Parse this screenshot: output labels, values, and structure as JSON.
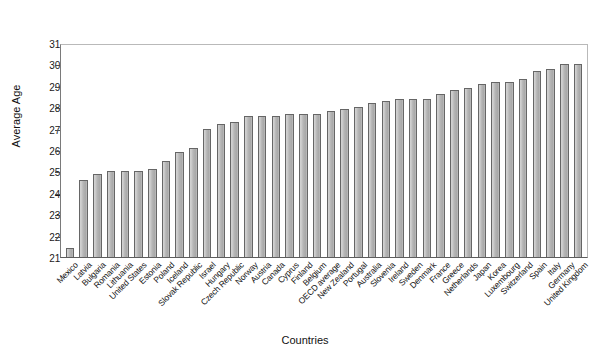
{
  "chart_data": {
    "type": "bar",
    "title": "",
    "xlabel": "Countries",
    "ylabel": "Average Age",
    "ylim": [
      21,
      31
    ],
    "yticks": [
      21,
      22,
      23,
      24,
      25,
      26,
      27,
      28,
      29,
      30,
      31
    ],
    "grid": false,
    "legend": null,
    "categories": [
      "Mexico",
      "Latvia",
      "Bulgaria",
      "Romania",
      "Lithuania",
      "United States",
      "Estonia",
      "Poland",
      "Iceland",
      "Slovak Republic",
      "Israel",
      "Hungary",
      "Czech Republic",
      "Norway",
      "Austria",
      "Canada",
      "Cyprus",
      "Finland",
      "Belgium",
      "OECD average",
      "New Zealand",
      "Portugal",
      "Australia",
      "Slovenia",
      "Ireland",
      "Sweden",
      "Denmark",
      "France",
      "Greece",
      "Netherlands",
      "Japan",
      "Korea",
      "Luxembourg",
      "Switzerland",
      "Spain",
      "Italy",
      "Germany",
      "United Kingdom"
    ],
    "values": [
      21.4,
      24.6,
      24.9,
      25.0,
      25.0,
      25.0,
      25.1,
      25.5,
      25.9,
      26.1,
      27.0,
      27.2,
      27.3,
      27.6,
      27.6,
      27.6,
      27.7,
      27.7,
      27.7,
      27.8,
      27.9,
      28.0,
      28.2,
      28.3,
      28.4,
      28.4,
      28.4,
      28.6,
      28.8,
      28.9,
      29.1,
      29.2,
      29.2,
      29.3,
      29.7,
      29.8,
      30.0,
      30.0
    ],
    "bar_color": "#b9b9b9",
    "bar_edge_color": "#666666",
    "axis_color": "#5d5d5d",
    "background_color": "#ffffff"
  }
}
